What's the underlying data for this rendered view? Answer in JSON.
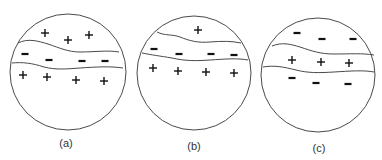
{
  "diagram": {
    "panels": [
      {
        "id": "a",
        "label": "(a)",
        "circle": {
          "cx": 68,
          "cy": 72,
          "r": 58
        },
        "label_pos": {
          "x": 66,
          "y": 147
        },
        "boundaries": [
          "M18,43 C28,38 38,41 48,44 C60,48 68,52 80,52 C95,52 108,50 119,52",
          "M12,63 C22,62 32,63 44,67 C56,70 66,69 80,68 C95,67 110,66 123,68"
        ],
        "layers": [
          {
            "name": "top-region",
            "sign": "+",
            "points": [
              [
                45,
                33
              ],
              [
                68,
                40
              ],
              [
                89,
                35
              ]
            ]
          },
          {
            "name": "middle-band",
            "sign": "-",
            "points": [
              [
                25,
                54
              ],
              [
                49,
                60
              ],
              [
                82,
                61
              ],
              [
                105,
                61
              ]
            ]
          },
          {
            "name": "bottom-region",
            "sign": "+",
            "points": [
              [
                23,
                75
              ],
              [
                47,
                77
              ],
              [
                76,
                80
              ],
              [
                104,
                81
              ]
            ]
          }
        ],
        "description": "Positive charges above, negative band in middle, positive charges below"
      },
      {
        "id": "b",
        "label": "(b)",
        "circle": {
          "cx": 194,
          "cy": 73,
          "r": 57
        },
        "label_pos": {
          "x": 194,
          "y": 150
        },
        "boundaries": [
          "M157,32 C165,36 172,34 180,37 C190,41 198,43 210,42 C222,41 232,41 241,43",
          "M142,53 C152,55 160,56 172,58 C185,61 196,61 210,60 C225,59 238,58 248,60"
        ],
        "layers": [
          {
            "name": "top-region",
            "sign": "+",
            "points": [
              [
                198,
                30
              ]
            ]
          },
          {
            "name": "middle-band",
            "sign": "-",
            "points": [
              [
                154,
                49
              ],
              [
                179,
                54
              ],
              [
                211,
                54
              ],
              [
                234,
                55
              ]
            ]
          },
          {
            "name": "bottom-region",
            "sign": "+",
            "points": [
              [
                153,
                68
              ],
              [
                178,
                71
              ],
              [
                206,
                72
              ],
              [
                234,
                73
              ]
            ]
          }
        ],
        "description": "Single positive charge above, negative band in middle, positive charges below"
      },
      {
        "id": "c",
        "label": "(c)",
        "circle": {
          "cx": 318,
          "cy": 75,
          "r": 57
        },
        "label_pos": {
          "x": 319,
          "y": 152
        },
        "boundaries": [
          "M272,46 C282,42 290,44 300,47 C312,51 320,54 334,54 C350,54 362,53 374,55",
          "M263,67 C274,65 284,67 296,70 C308,73 318,73 334,72 C350,71 364,70 374,72"
        ],
        "layers": [
          {
            "name": "top-region",
            "sign": "-",
            "points": [
              [
                297,
                33
              ],
              [
                322,
                39
              ],
              [
                353,
                39
              ]
            ]
          },
          {
            "name": "middle-band",
            "sign": "+",
            "points": [
              [
                292,
                60
              ],
              [
                321,
                62
              ],
              [
                349,
                63
              ]
            ]
          },
          {
            "name": "bottom-region",
            "sign": "-",
            "points": [
              [
                292,
                78
              ],
              [
                316,
                83
              ],
              [
                348,
                84
              ]
            ]
          }
        ],
        "description": "Negative charges above, positive band in middle, negative charges below"
      }
    ]
  }
}
